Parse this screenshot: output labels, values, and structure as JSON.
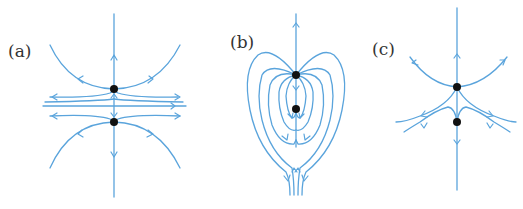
{
  "figure": {
    "colors": {
      "streamline": "#5aa4dc",
      "fixed_point": "#111111",
      "label": "#333333",
      "background": "#ffffff"
    },
    "panels": [
      {
        "id": "a",
        "label": "(a)",
        "fixed_points": 2,
        "structure": "two saddle-like points on vertical axis with hyperbolic streamlines opening up and down, horizontal separatrix"
      },
      {
        "id": "b",
        "label": "(b)",
        "fixed_points": 2,
        "structure": "heart-shaped nested loops from upper point looping down and back, flows exiting downward"
      },
      {
        "id": "c",
        "label": "(c)",
        "fixed_points": 2,
        "structure": "upper point with arcs opening upward and curves fanning out lower-left and lower-right"
      }
    ]
  }
}
